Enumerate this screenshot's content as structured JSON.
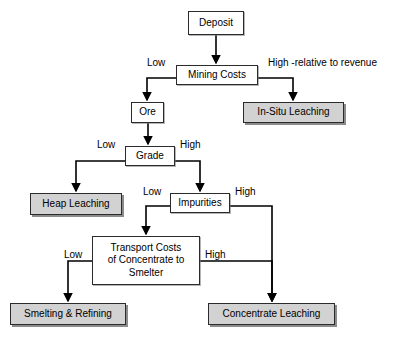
{
  "diagram": {
    "colors": {
      "terminal_fill": "#d2d2d2",
      "process_fill": "#ffffff",
      "border": "#2b2b2b",
      "line": "#000000",
      "background": "#ffffff"
    },
    "nodes": [
      {
        "id": "deposit",
        "label": "Deposit",
        "type": "process",
        "x": 188,
        "y": 11,
        "w": 56,
        "h": 24
      },
      {
        "id": "mining_costs",
        "label": "Mining Costs",
        "type": "process",
        "x": 176,
        "y": 65,
        "w": 82,
        "h": 20
      },
      {
        "id": "in_situ_leaching",
        "label": "In-Situ Leaching",
        "type": "terminal",
        "x": 243,
        "y": 102,
        "w": 101,
        "h": 21
      },
      {
        "id": "ore",
        "label": "Ore",
        "type": "process",
        "x": 131,
        "y": 102,
        "w": 33,
        "h": 21
      },
      {
        "id": "grade",
        "label": "Grade",
        "type": "process",
        "x": 125,
        "y": 146,
        "w": 50,
        "h": 20
      },
      {
        "id": "heap_leaching",
        "label": "Heap Leaching",
        "type": "terminal",
        "x": 30,
        "y": 193,
        "w": 92,
        "h": 22
      },
      {
        "id": "impurities",
        "label": "Impurities",
        "type": "process",
        "x": 170,
        "y": 193,
        "w": 60,
        "h": 20
      },
      {
        "id": "transport_costs",
        "label": "Transport Costs\nof Concentrate to\nSmelter",
        "type": "process",
        "x": 92,
        "y": 236,
        "w": 108,
        "h": 49
      },
      {
        "id": "smelting_refining",
        "label": "Smelting & Refining",
        "type": "terminal",
        "x": 10,
        "y": 303,
        "w": 116,
        "h": 22
      },
      {
        "id": "concentrate_leaching",
        "label": "Concentrate Leaching",
        "type": "terminal",
        "x": 208,
        "y": 303,
        "w": 127,
        "h": 22
      }
    ],
    "edge_labels": [
      {
        "id": "mining_low",
        "text": "Low",
        "x": 147,
        "y": 57
      },
      {
        "id": "mining_high",
        "text": "High -relative to revenue",
        "x": 268,
        "y": 57
      },
      {
        "id": "grade_low",
        "text": "Low",
        "x": 97,
        "y": 139
      },
      {
        "id": "grade_high",
        "text": "High",
        "x": 180,
        "y": 139
      },
      {
        "id": "impurities_low",
        "text": "Low",
        "x": 143,
        "y": 186
      },
      {
        "id": "impurities_high",
        "text": "High",
        "x": 235,
        "y": 186
      },
      {
        "id": "transport_low",
        "text": "Low",
        "x": 64,
        "y": 249
      },
      {
        "id": "transport_high",
        "text": "High",
        "x": 205,
        "y": 249
      }
    ]
  }
}
